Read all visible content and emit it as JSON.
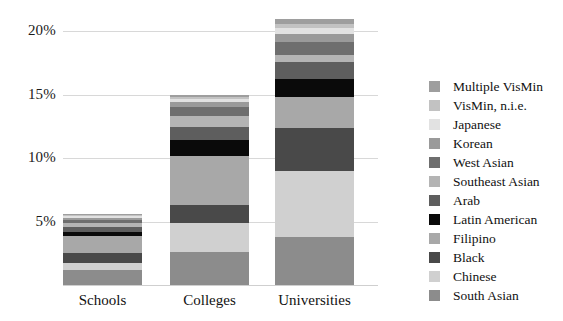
{
  "chart_data": {
    "type": "bar",
    "subtype": "stacked-bar",
    "title": "",
    "xlabel": "",
    "ylabel": "",
    "categories": [
      "Schools",
      "Colleges",
      "Universities"
    ],
    "ylim": [
      0,
      21.5
    ],
    "ytick_values": [
      5,
      10,
      15,
      20
    ],
    "ytick_labels": [
      "5%",
      "10%",
      "15%",
      "20%"
    ],
    "grid": true,
    "legend_position": "right",
    "stack_order_bottom_to_top": [
      "South Asian",
      "Chinese",
      "Black",
      "Filipino",
      "Latin American",
      "Arab",
      "Southeast Asian",
      "West Asian",
      "Korean",
      "Japanese",
      "VisMin, n.i.e.",
      "Multiple VisMin"
    ],
    "series": [
      {
        "name": "South Asian",
        "color": "#8c8c8c",
        "values": [
          1.15,
          2.6,
          3.8
        ]
      },
      {
        "name": "Chinese",
        "color": "#d0d0d0",
        "values": [
          0.55,
          2.25,
          5.2
        ]
      },
      {
        "name": "Black",
        "color": "#494949",
        "values": [
          0.85,
          1.45,
          3.35
        ]
      },
      {
        "name": "Filipino",
        "color": "#a8a8a8",
        "values": [
          1.35,
          3.85,
          2.45
        ]
      },
      {
        "name": "Latin American",
        "color": "#0a0a0a",
        "values": [
          0.3,
          1.25,
          1.45
        ]
      },
      {
        "name": "Arab",
        "color": "#5e5e5e",
        "values": [
          0.35,
          1.05,
          1.3
        ]
      },
      {
        "name": "Southeast Asian",
        "color": "#b4b4b4",
        "values": [
          0.3,
          0.85,
          0.55
        ]
      },
      {
        "name": "West Asian",
        "color": "#6e6e6e",
        "values": [
          0.3,
          0.7,
          1.05
        ]
      },
      {
        "name": "Korean",
        "color": "#9a9a9a",
        "values": [
          0.15,
          0.4,
          0.65
        ]
      },
      {
        "name": "Japanese",
        "color": "#e2e2e2",
        "values": [
          0.12,
          0.25,
          0.45
        ]
      },
      {
        "name": "VisMin, n.i.e.",
        "color": "#c2c2c2",
        "values": [
          0.1,
          0.2,
          0.35
        ]
      },
      {
        "name": "Multiple VisMin",
        "color": "#9e9e9e",
        "values": [
          0.08,
          0.15,
          0.35
        ]
      }
    ],
    "totals": [
      5.6,
      15.0,
      20.95
    ]
  },
  "legend": {
    "items": [
      {
        "label": "Multiple VisMin",
        "color": "#9e9e9e"
      },
      {
        "label": "VisMin, n.i.e.",
        "color": "#c2c2c2"
      },
      {
        "label": "Japanese",
        "color": "#e2e2e2"
      },
      {
        "label": "Korean",
        "color": "#9a9a9a"
      },
      {
        "label": "West Asian",
        "color": "#6e6e6e"
      },
      {
        "label": "Southeast Asian",
        "color": "#b4b4b4"
      },
      {
        "label": "Arab",
        "color": "#5e5e5e"
      },
      {
        "label": "Latin American",
        "color": "#0a0a0a"
      },
      {
        "label": "Filipino",
        "color": "#a8a8a8"
      },
      {
        "label": "Black",
        "color": "#494949"
      },
      {
        "label": "Chinese",
        "color": "#d0d0d0"
      },
      {
        "label": "South Asian",
        "color": "#8c8c8c"
      }
    ]
  },
  "axes": {
    "grid_color": "#d8d8d8",
    "baseline_color": "#cfcfcf"
  }
}
